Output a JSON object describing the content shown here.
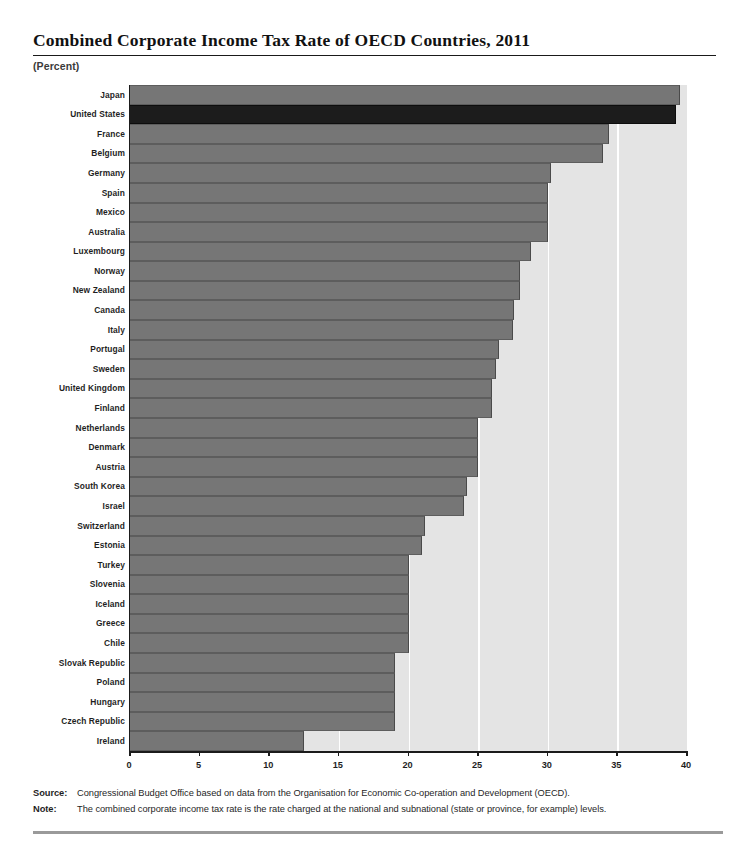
{
  "title": "Combined Corporate Income Tax Rate of OECD Countries, 2011",
  "unit_label": "(Percent)",
  "notes": {
    "source_label": "Source:",
    "source_text": "Congressional Budget Office based on data from the Organisation for Economic Co-operation and Development (OECD).",
    "note_label": "Note:",
    "note_text": "The combined corporate income tax rate is the rate charged at the national and subnational (state or province, for example) levels."
  },
  "colors": {
    "bar": "#767676",
    "highlight_bar": "#1c1c1c",
    "plot_background": "#e4e4e4",
    "gridline": "#ffffff",
    "axis": "#1b1b1b"
  },
  "chart_data": {
    "type": "bar",
    "orientation": "horizontal",
    "title": "Combined Corporate Income Tax Rate of OECD Countries, 2011",
    "xlabel": "(Percent)",
    "ylabel": "",
    "xlim": [
      0,
      40
    ],
    "xticks": [
      0,
      5,
      10,
      15,
      20,
      25,
      30,
      35,
      40
    ],
    "grid": "vertical",
    "legend": "none",
    "highlight_category": "United States",
    "categories": [
      "Japan",
      "United States",
      "France",
      "Belgium",
      "Germany",
      "Spain",
      "Mexico",
      "Australia",
      "Luxembourg",
      "Norway",
      "New Zealand",
      "Canada",
      "Italy",
      "Portugal",
      "Sweden",
      "United Kingdom",
      "Finland",
      "Netherlands",
      "Denmark",
      "Austria",
      "South Korea",
      "Israel",
      "Switzerland",
      "Estonia",
      "Turkey",
      "Slovenia",
      "Iceland",
      "Greece",
      "Chile",
      "Slovak Republic",
      "Poland",
      "Hungary",
      "Czech Republic",
      "Ireland"
    ],
    "values": [
      39.5,
      39.2,
      34.4,
      34.0,
      30.2,
      30.0,
      30.0,
      30.0,
      28.8,
      28.0,
      28.0,
      27.6,
      27.5,
      26.5,
      26.3,
      26.0,
      26.0,
      25.0,
      25.0,
      25.0,
      24.2,
      24.0,
      21.2,
      21.0,
      20.0,
      20.0,
      20.0,
      20.0,
      20.0,
      19.0,
      19.0,
      19.0,
      19.0,
      12.5
    ]
  }
}
